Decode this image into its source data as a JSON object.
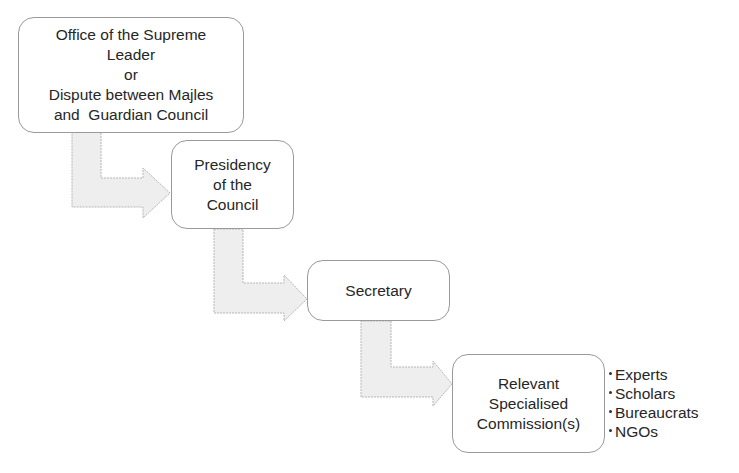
{
  "diagram": {
    "type": "hierarchical-flow",
    "nodes": [
      {
        "id": "office-supreme-leader",
        "lines": [
          "Office of the Supreme",
          "Leader",
          "or",
          "Dispute between Majles",
          "and  Guardian Council"
        ]
      },
      {
        "id": "presidency",
        "lines": [
          "Presidency",
          "of the",
          "Council"
        ]
      },
      {
        "id": "secretary",
        "lines": [
          "Secretary"
        ]
      },
      {
        "id": "commissions",
        "lines": [
          "Relevant",
          "Specialised",
          "Commission(s)"
        ]
      }
    ],
    "edges": [
      {
        "from": "office-supreme-leader",
        "to": "presidency",
        "style": "L-shaped block arrow"
      },
      {
        "from": "presidency",
        "to": "secretary",
        "style": "L-shaped block arrow"
      },
      {
        "from": "secretary",
        "to": "commissions",
        "style": "L-shaped block arrow"
      }
    ],
    "commission_members": [
      "Experts",
      "Scholars",
      "Bureaucrats",
      "NGOs"
    ],
    "colors": {
      "node_border": "#9a9a9a",
      "arrow_fill": "#eeeeee",
      "arrow_stroke": "#b5b5b5",
      "text": "#262626"
    }
  }
}
